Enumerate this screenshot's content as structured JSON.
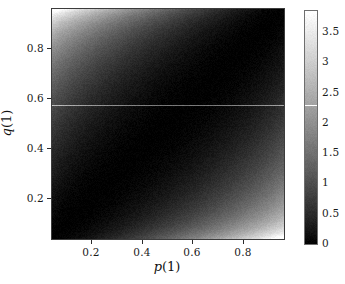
{
  "figure": {
    "background": "#ffffff",
    "width": 345,
    "height": 284
  },
  "axes": {
    "xlabel_var": "p",
    "xlabel_arg": "(1)",
    "ylabel_var": "q",
    "ylabel_arg": "(1)",
    "xticks": [
      {
        "label": "0.2",
        "value": 0.2
      },
      {
        "label": "0.4",
        "value": 0.4
      },
      {
        "label": "0.6",
        "value": 0.6
      },
      {
        "label": "0.8",
        "value": 0.8
      }
    ],
    "yticks": [
      {
        "label": "0.2",
        "value": 0.2
      },
      {
        "label": "0.4",
        "value": 0.4
      },
      {
        "label": "0.6",
        "value": 0.6
      },
      {
        "label": "0.8",
        "value": 0.8
      }
    ],
    "xlim": [
      0.04,
      0.96
    ],
    "ylim": [
      0.04,
      0.96
    ]
  },
  "colorbar": {
    "ticks": [
      {
        "label": "3.5",
        "value": 3.5
      },
      {
        "label": "3",
        "value": 3
      },
      {
        "label": "2.5",
        "value": 2.5
      },
      {
        "label": "2",
        "value": 2
      },
      {
        "label": "1.5",
        "value": 1.5
      },
      {
        "label": "1",
        "value": 1
      },
      {
        "label": "0.5",
        "value": 0.5
      },
      {
        "label": "0",
        "value": 0
      }
    ],
    "vmin": 0,
    "vmax": 3.85,
    "low_color": "#000000",
    "high_color": "#ffffff",
    "orientation": "vertical"
  },
  "chart_data": {
    "type": "heatmap",
    "title": "",
    "xlabel": "p(1)",
    "ylabel": "q(1)",
    "colormap": "gray",
    "xlim": [
      0.04,
      0.96
    ],
    "ylim": [
      0.04,
      0.96
    ],
    "zlim": [
      0,
      3.85
    ],
    "grid": false,
    "legend": "colorbar-right",
    "function": "binary_kl_divergence",
    "x": [
      0.05,
      0.15,
      0.25,
      0.35,
      0.45,
      0.55,
      0.65,
      0.75,
      0.85,
      0.95
    ],
    "y": [
      0.05,
      0.15,
      0.25,
      0.35,
      0.45,
      0.55,
      0.65,
      0.75,
      0.85,
      0.95
    ],
    "z": [
      [
        0.0,
        0.17,
        0.4,
        0.67,
        0.99,
        1.36,
        1.81,
        2.37,
        3.14,
        4.25
      ],
      [
        0.18,
        0.0,
        0.05,
        0.17,
        0.35,
        0.6,
        0.93,
        1.37,
        2.02,
        3.02
      ],
      [
        0.45,
        0.05,
        0.0,
        0.04,
        0.15,
        0.32,
        0.57,
        0.93,
        1.48,
        2.38
      ],
      [
        0.79,
        0.18,
        0.04,
        0.0,
        0.03,
        0.14,
        0.32,
        0.6,
        1.07,
        1.88
      ],
      [
        1.21,
        0.38,
        0.15,
        0.03,
        0.0,
        0.03,
        0.14,
        0.35,
        0.73,
        1.46
      ],
      [
        1.72,
        0.67,
        0.33,
        0.14,
        0.03,
        0.0,
        0.03,
        0.17,
        0.47,
        1.1
      ],
      [
        2.36,
        1.06,
        0.62,
        0.33,
        0.14,
        0.03,
        0.0,
        0.05,
        0.26,
        0.78
      ],
      [
        3.21,
        1.62,
        1.05,
        0.66,
        0.37,
        0.17,
        0.04,
        0.0,
        0.09,
        0.48
      ],
      [
        4.46,
        2.51,
        1.77,
        1.23,
        0.81,
        0.49,
        0.24,
        0.08,
        0.0,
        0.18
      ],
      [
        6.75,
        4.27,
        3.25,
        2.5,
        1.88,
        1.36,
        0.91,
        0.52,
        0.18,
        0.0
      ]
    ]
  }
}
